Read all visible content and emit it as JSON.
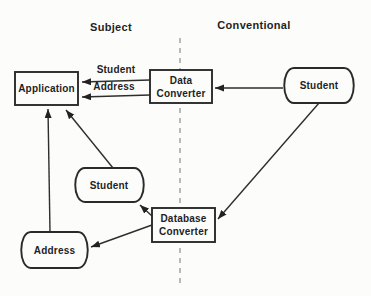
{
  "headers": {
    "subject": "Subject",
    "conventional": "Conventional"
  },
  "nodes": {
    "application": {
      "label": "Application",
      "shape": "rectangle"
    },
    "data_converter": {
      "line1": "Data",
      "line2": "Converter",
      "shape": "rectangle"
    },
    "student_conventional": {
      "label": "Student",
      "shape": "data-store"
    },
    "student_subject": {
      "label": "Student",
      "shape": "data-store"
    },
    "database_converter": {
      "line1": "Database",
      "line2": "Converter",
      "shape": "rectangle"
    },
    "address": {
      "label": "Address",
      "shape": "data-store"
    }
  },
  "edge_labels": {
    "student": "Student",
    "address": "Address"
  },
  "edges": [
    {
      "from": "data_converter",
      "to": "application",
      "label": "Student"
    },
    {
      "from": "data_converter",
      "to": "application",
      "label": "Address"
    },
    {
      "from": "student_conventional",
      "to": "data_converter",
      "label": ""
    },
    {
      "from": "student_conventional",
      "to": "database_converter",
      "label": ""
    },
    {
      "from": "database_converter",
      "to": "student_subject",
      "label": ""
    },
    {
      "from": "database_converter",
      "to": "address",
      "label": ""
    },
    {
      "from": "address",
      "to": "application",
      "label": ""
    },
    {
      "from": "student_subject",
      "to": "application",
      "label": ""
    }
  ],
  "colors": {
    "background": "#fcfcfb",
    "line": "#2e2e2e",
    "text": "#1f1f1f",
    "divider": "#a3a3a3",
    "arrowhead": "#222222"
  }
}
